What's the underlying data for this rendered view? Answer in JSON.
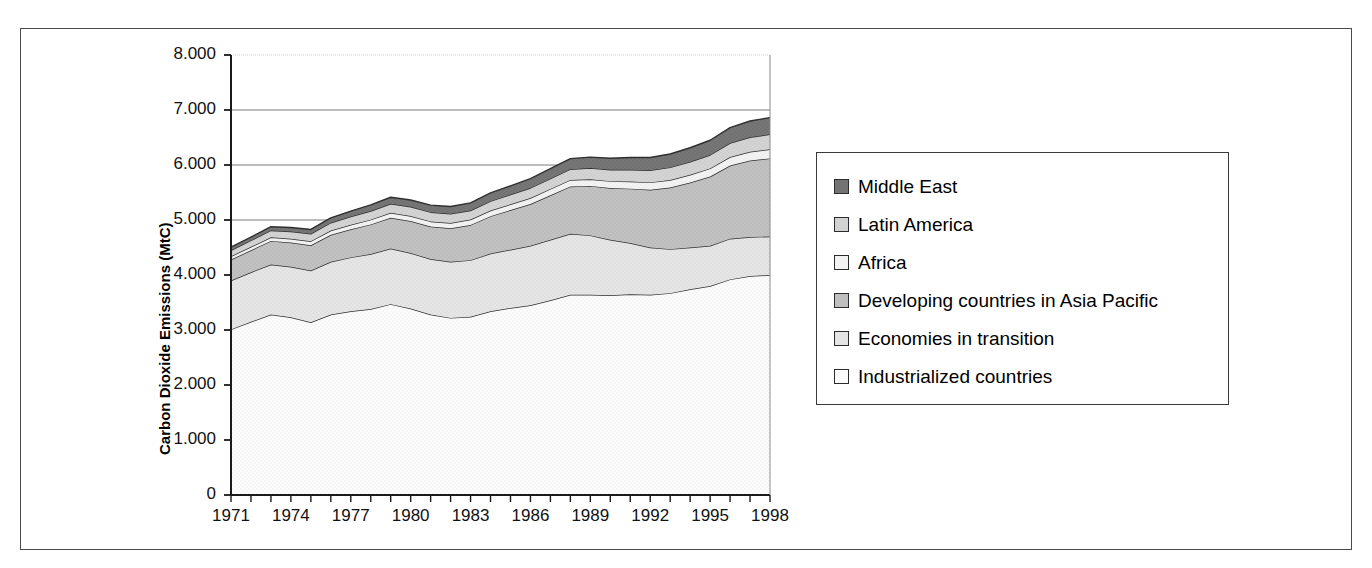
{
  "figure": {
    "title": "",
    "frame_color": "#4a4a4a",
    "background": "#ffffff"
  },
  "axis": {
    "ylabel": "Carbon Dioxide Emissions (MtC)",
    "yticks": [
      "0",
      "1.000",
      "2.000",
      "3.000",
      "4.000",
      "5.000",
      "6.000",
      "7.000",
      "8.000"
    ],
    "xticks": [
      "1971",
      "1974",
      "1977",
      "1980",
      "1983",
      "1986",
      "1989",
      "1992",
      "1995",
      "1998"
    ]
  },
  "legend": {
    "items": [
      {
        "label": "Middle East",
        "color": "#737373"
      },
      {
        "label": "Latin America",
        "color": "#d2d2d2"
      },
      {
        "label": "Africa",
        "color": "#f2f2f2"
      },
      {
        "label": "Developing countries in Asia Pacific",
        "color": "#bfbfbf"
      },
      {
        "label": "Economies in transition",
        "color": "#e4e4e4"
      },
      {
        "label": "Industrialized countries",
        "color": "#fbfbfb"
      }
    ]
  },
  "chart_data": {
    "type": "area",
    "stacked": true,
    "title": "",
    "xlabel": "",
    "ylabel": "Carbon Dioxide Emissions (MtC)",
    "xlim": [
      1971,
      1998
    ],
    "ylim": [
      0,
      8000
    ],
    "ytick_values": [
      0,
      1000,
      2000,
      3000,
      4000,
      5000,
      6000,
      7000,
      8000
    ],
    "grid": "horizontal-major",
    "legend_position": "right",
    "x": [
      1971,
      1972,
      1973,
      1974,
      1975,
      1976,
      1977,
      1978,
      1979,
      1980,
      1981,
      1982,
      1983,
      1984,
      1985,
      1986,
      1987,
      1988,
      1989,
      1990,
      1991,
      1992,
      1993,
      1994,
      1995,
      1996,
      1997,
      1998
    ],
    "series": [
      {
        "name": "Industrialized countries",
        "color": "#fbfbfb",
        "values": [
          3010,
          3150,
          3280,
          3230,
          3140,
          3280,
          3340,
          3380,
          3470,
          3390,
          3280,
          3220,
          3240,
          3340,
          3400,
          3450,
          3540,
          3640,
          3640,
          3630,
          3650,
          3640,
          3670,
          3740,
          3800,
          3920,
          3980,
          4000
        ]
      },
      {
        "name": "Economies in transition",
        "color": "#e4e4e4",
        "values": [
          890,
          900,
          910,
          920,
          940,
          960,
          980,
          1000,
          1010,
          1010,
          1010,
          1020,
          1030,
          1050,
          1060,
          1080,
          1100,
          1110,
          1080,
          1010,
          930,
          860,
          800,
          760,
          730,
          740,
          710,
          700
        ]
      },
      {
        "name": "Developing countries in Asia Pacific",
        "color": "#bfbfbf",
        "values": [
          380,
          400,
          430,
          440,
          460,
          490,
          510,
          540,
          560,
          580,
          590,
          610,
          640,
          680,
          720,
          760,
          810,
          860,
          900,
          940,
          990,
          1050,
          1120,
          1180,
          1260,
          1330,
          1390,
          1420
        ]
      },
      {
        "name": "Africa",
        "color": "#f2f2f2",
        "values": [
          60,
          62,
          66,
          70,
          74,
          78,
          82,
          86,
          90,
          92,
          94,
          96,
          98,
          102,
          106,
          110,
          114,
          118,
          122,
          126,
          130,
          134,
          138,
          142,
          148,
          154,
          160,
          165
        ]
      },
      {
        "name": "Latin America",
        "color": "#d2d2d2",
        "values": [
          110,
          116,
          124,
          130,
          134,
          142,
          150,
          158,
          166,
          168,
          168,
          166,
          164,
          170,
          176,
          182,
          188,
          196,
          202,
          208,
          214,
          220,
          228,
          236,
          244,
          254,
          264,
          272
        ]
      },
      {
        "name": "Middle East",
        "color": "#737373",
        "values": [
          55,
          60,
          68,
          74,
          80,
          90,
          100,
          110,
          118,
          124,
          128,
          134,
          140,
          150,
          160,
          170,
          180,
          192,
          200,
          210,
          222,
          232,
          244,
          256,
          268,
          282,
          296,
          305
        ]
      }
    ],
    "totals": [
      4505,
      4688,
      4878,
      4864,
      4828,
      5040,
      5162,
      5274,
      5414,
      5364,
      5270,
      5246,
      5312,
      5492,
      5622,
      5752,
      5932,
      6116,
      6144,
      6124,
      6136,
      6136,
      6200,
      6314,
      6450,
      6680,
      6800,
      6862
    ]
  }
}
